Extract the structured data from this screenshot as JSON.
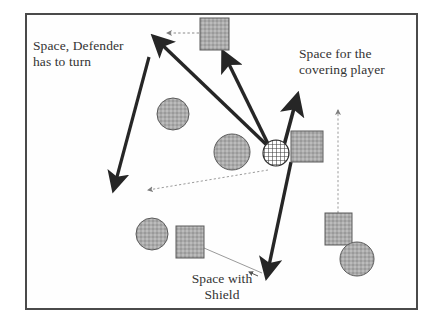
{
  "diagram": {
    "frame": {
      "x": 25,
      "y": 13,
      "width": 393,
      "height": 297,
      "border_color": "#4a4a4a"
    },
    "colors": {
      "piece_fill": "#a8a8a8",
      "piece_stroke": "#5a5a5a",
      "arrow_thick": "#262626",
      "arrow_thin": "#8a8a8a",
      "frame": "#4a4a4a",
      "text": "#333333",
      "background": "#ffffff"
    },
    "labels": [
      {
        "name": "space-defender-turn",
        "text": "Space, Defender\nhas to turn",
        "x": 33,
        "y": 38
      },
      {
        "name": "space-covering-player",
        "text": "Space for the\ncovering player",
        "x": 299,
        "y": 46
      },
      {
        "name": "space-with-shield",
        "text": "Space with\nShield",
        "x": 167,
        "y": 271
      }
    ],
    "pieces": [
      {
        "name": "square-top",
        "shape": "square",
        "fill": "hatched-gray",
        "x": 200,
        "y": 18,
        "width": 29,
        "height": 32
      },
      {
        "name": "circle-upper-left",
        "shape": "circle",
        "fill": "hatched-gray",
        "cx": 173,
        "cy": 114,
        "r": 16
      },
      {
        "name": "circle-center-left",
        "shape": "circle",
        "fill": "hatched-gray",
        "cx": 232,
        "cy": 152,
        "r": 18
      },
      {
        "name": "circle-ball-center",
        "shape": "circle",
        "fill": "cross-hatch",
        "cx": 276,
        "cy": 153,
        "r": 13
      },
      {
        "name": "square-center-right",
        "shape": "square",
        "fill": "hatched-gray",
        "x": 291,
        "y": 131,
        "width": 32,
        "height": 31
      },
      {
        "name": "circle-lower-left",
        "shape": "circle",
        "fill": "hatched-gray",
        "cx": 152,
        "cy": 234,
        "r": 16
      },
      {
        "name": "square-lower-left",
        "shape": "square",
        "fill": "hatched-gray",
        "x": 176,
        "y": 226,
        "width": 28,
        "height": 32
      },
      {
        "name": "square-lower-right",
        "shape": "square",
        "fill": "hatched-gray",
        "x": 325,
        "y": 213,
        "width": 27,
        "height": 32
      },
      {
        "name": "circle-lower-right",
        "shape": "circle",
        "fill": "hatched-gray",
        "cx": 357,
        "cy": 259,
        "r": 17
      }
    ],
    "arrows": [
      {
        "name": "arrow-center-to-upper-left",
        "style": "thick",
        "from": [
          272,
          150
        ],
        "to": [
          153,
          36
        ],
        "heads": "end"
      },
      {
        "name": "arrow-center-to-top-square",
        "style": "thick",
        "from": [
          272,
          152
        ],
        "to": [
          224,
          53
        ],
        "heads": "end"
      },
      {
        "name": "arrow-double-down-left",
        "style": "thick",
        "from": [
          149,
          57
        ],
        "to": [
          113,
          190
        ],
        "heads": "end"
      },
      {
        "name": "arrow-center-to-up-right",
        "style": "thick",
        "from": [
          278,
          163
        ],
        "to": [
          297,
          95
        ],
        "heads": "end"
      },
      {
        "name": "arrow-center-down-to-bottom",
        "style": "thick",
        "from": [
          291,
          163
        ],
        "to": [
          266,
          277
        ],
        "heads": "end"
      },
      {
        "name": "arrow-dotted-top-left",
        "style": "dotted",
        "from": [
          199,
          33
        ],
        "to": [
          166,
          33
        ],
        "heads": "end"
      },
      {
        "name": "arrow-dotted-center-down-left",
        "style": "dotted",
        "from": [
          268,
          170
        ],
        "to": [
          146,
          191
        ],
        "heads": "end"
      },
      {
        "name": "arrow-dotted-right-up",
        "style": "dotted",
        "from": [
          338,
          213
        ],
        "to": [
          338,
          108
        ],
        "heads": "end"
      },
      {
        "name": "leader-line-shield",
        "style": "thin",
        "from": [
          204,
          248
        ],
        "to": [
          262,
          273
        ],
        "heads": "none"
      },
      {
        "name": "arrow-small-shield-tip",
        "style": "thin-head",
        "from": [
          256,
          275
        ],
        "to": [
          248,
          272
        ],
        "heads": "end"
      }
    ]
  }
}
